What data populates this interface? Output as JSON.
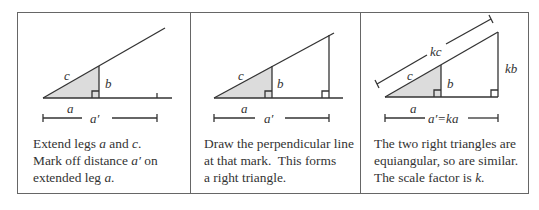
{
  "colors": {
    "line": "#333333",
    "frame": "#666666",
    "shade": "#dcdcdc",
    "background": "#ffffff"
  },
  "panels": [
    {
      "labels": {
        "c": "c",
        "b": "b",
        "a": "a",
        "a_prime": "a′"
      },
      "caption": {
        "line1_pre": "Extend legs ",
        "line1_a": "a",
        "line1_mid": " and ",
        "line1_c": "c",
        "line1_end": ".",
        "line2_pre": "Mark off distance ",
        "line2_aprime": "a′",
        "line2_end": " on",
        "line3_pre": "extended leg ",
        "line3_a": "a",
        "line3_end": "."
      }
    },
    {
      "labels": {
        "c": "c",
        "b": "b",
        "a": "a",
        "a_prime": "a′"
      },
      "caption": {
        "line1": "Draw the perpendicular line",
        "line2": "at that mark.  This forms",
        "line3": "a right triangle."
      }
    },
    {
      "labels": {
        "kc": "kc",
        "c": "c",
        "b": "b",
        "kb": "kb",
        "a": "a",
        "a_prime_eq": "a′=ka"
      },
      "caption": {
        "line1": "The two right triangles are",
        "line2": "equiangular, so are similar.",
        "line3_pre": "The scale factor is ",
        "line3_k": "k",
        "line3_end": "."
      }
    }
  ]
}
